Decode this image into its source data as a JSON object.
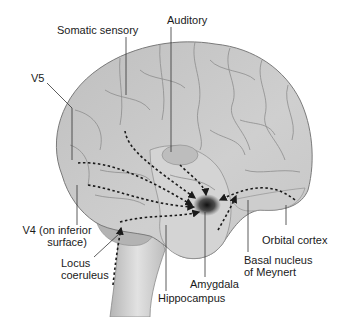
{
  "diagram": {
    "colors": {
      "background": "#ffffff",
      "brain_fill": "#c4c4c4",
      "brain_light": "#dcdcdc",
      "brain_dark": "#a9a9a9",
      "sulcus_line": "#8a8a8a",
      "outline": "#7a7a7a",
      "pathway": "#1a1a1a",
      "amygdala": "#222222",
      "label_text": "#1a1a1a",
      "leader_line": "#333333"
    },
    "labels": {
      "somatic_sensory": "Somatic sensory",
      "auditory": "Auditory",
      "v5": "V5",
      "v4_line1": "V4 (on inferior",
      "v4_line2": "surface)",
      "locus_line1": "Locus",
      "locus_line2": "coeruleus",
      "hippocampus": "Hippocampus",
      "amygdala": "Amygdala",
      "basal_line1": "Basal nucleus",
      "basal_line2": "of Meynert",
      "orbital_cortex": "Orbital cortex"
    },
    "pathways_converge_on": "Amygdala"
  }
}
